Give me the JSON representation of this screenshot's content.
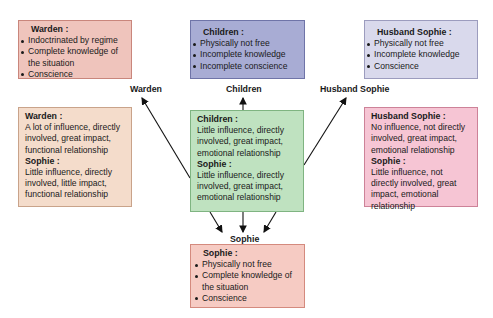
{
  "colors": {
    "warden_top_fill": "#efc4bc",
    "warden_top_border": "#c9867c",
    "children_top_fill": "#a8acd4",
    "children_top_border": "#6f74a8",
    "husband_top_fill": "#d9d9ec",
    "husband_top_border": "#9c9cbe",
    "warden_mid_fill": "#f4dccb",
    "warden_mid_border": "#c9a38a",
    "center_fill": "#bfe2c0",
    "center_border": "#7fb481",
    "husband_mid_fill": "#f6c5d4",
    "husband_mid_border": "#cd8298",
    "sophie_bottom_fill": "#f6cbc3",
    "sophie_bottom_border": "#d48a7e"
  },
  "top": {
    "warden": {
      "title": "Warden :",
      "items": [
        "Indoctrinated by regime",
        "Complete knowledge of the situation",
        "Conscience"
      ]
    },
    "children": {
      "title": "Children :",
      "items": [
        "Physically not free",
        "Incomplete knowledge",
        "Incomplete conscience"
      ]
    },
    "husband": {
      "title": "Husband Sophie :",
      "items": [
        "Physically not free",
        "Incomplete knowledge",
        "Conscience"
      ]
    }
  },
  "labels": {
    "warden": "Warden",
    "children": "Children",
    "husband": "Husband Sophie",
    "sophie": "Sophie"
  },
  "middle": {
    "warden": {
      "t1": "Warden :",
      "d1": "A lot of influence, directly involved, great impact, functional relationship",
      "t2": "Sophie :",
      "d2": "Little influence, directly involved, little impact, functional relationship"
    },
    "center": {
      "t1": "Children :",
      "d1": "Little influence, directly involved, great impact, emotional relationship",
      "t2": "Sophie :",
      "d2": "Little influence, directly involved, great impact, emotional relationship"
    },
    "husband": {
      "t1": "Husband Sophie :",
      "d1": "No influence, not directly involved, great impact, emotional relationship",
      "t2": "Sophie :",
      "d2": "Little influence, not directly involved, great impact, emotional relationship"
    }
  },
  "bottom": {
    "sophie": {
      "title": "Sophie :",
      "items": [
        "Physically not free",
        "Complete knowledge of the situation",
        "Conscience"
      ]
    }
  }
}
